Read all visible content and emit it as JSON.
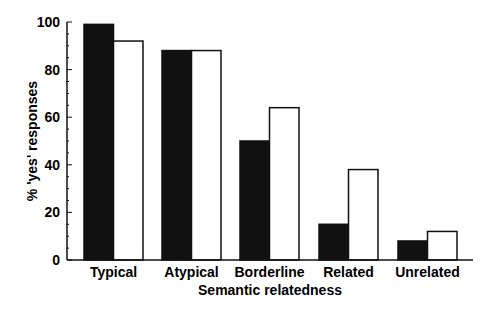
{
  "chart_data": {
    "type": "bar",
    "title": "",
    "xlabel": "Semantic relatedness",
    "ylabel": "% 'yes' responses",
    "categories": [
      "Typical",
      "Atypical",
      "Borderline",
      "Related",
      "Unrelated"
    ],
    "series": [
      {
        "name": "Series 1 (filled)",
        "color": "#111111",
        "values": [
          99,
          88,
          50,
          15,
          8
        ]
      },
      {
        "name": "Series 2 (open)",
        "color": "#ffffff",
        "values": [
          92,
          88,
          64,
          38,
          12
        ]
      }
    ],
    "ylim": [
      0,
      100
    ],
    "yticks": [
      0,
      20,
      40,
      60,
      80,
      100
    ],
    "grid": false,
    "legend": "none"
  }
}
